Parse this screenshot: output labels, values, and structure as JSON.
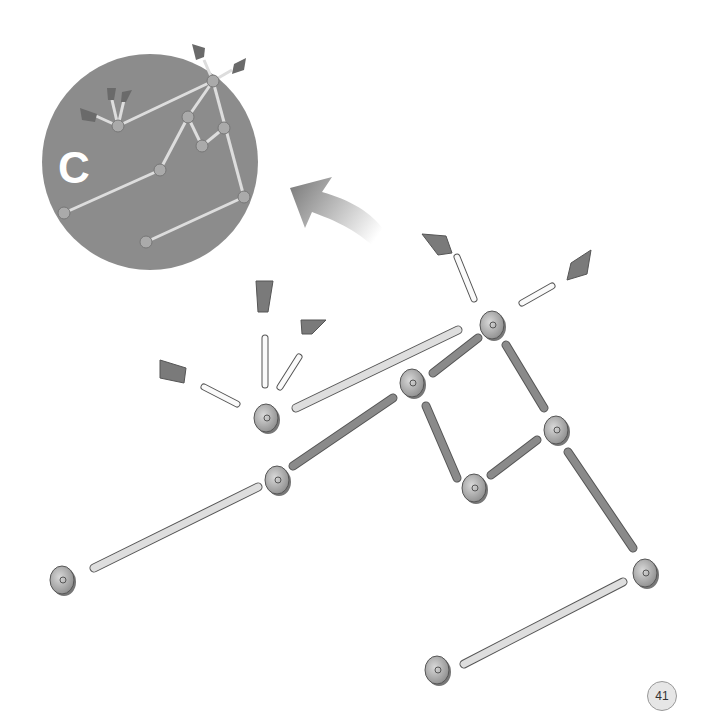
{
  "page": {
    "number": "41"
  },
  "inset": {
    "step_label": "C",
    "circle_color": "#8c8c8c"
  },
  "arrow": {
    "direction": "up-left",
    "color": "#808080"
  },
  "colors": {
    "rod_light": "#e4e4e4",
    "rod_dark": "#8a8a8a",
    "hub": "#a8a8a8",
    "flag": "#7a7a7a",
    "leader": "#555555"
  },
  "parts": {
    "hubs": [
      {
        "id": "h1",
        "x": 266,
        "y": 418
      },
      {
        "id": "h2",
        "x": 492,
        "y": 325
      },
      {
        "id": "h3",
        "x": 412,
        "y": 383
      },
      {
        "id": "h4",
        "x": 556,
        "y": 430
      },
      {
        "id": "h5",
        "x": 474,
        "y": 488
      },
      {
        "id": "h6",
        "x": 277,
        "y": 480
      },
      {
        "id": "h7",
        "x": 62,
        "y": 580
      },
      {
        "id": "h8",
        "x": 645,
        "y": 573
      },
      {
        "id": "h9",
        "x": 437,
        "y": 670
      }
    ],
    "rods": [
      {
        "x1": 296,
        "y1": 408,
        "x2": 458,
        "y2": 330,
        "type": "light"
      },
      {
        "x1": 433,
        "y1": 373,
        "x2": 478,
        "y2": 338,
        "type": "dark"
      },
      {
        "x1": 293,
        "y1": 466,
        "x2": 393,
        "y2": 398,
        "type": "dark"
      },
      {
        "x1": 426,
        "y1": 406,
        "x2": 457,
        "y2": 478,
        "type": "dark"
      },
      {
        "x1": 491,
        "y1": 475,
        "x2": 537,
        "y2": 440,
        "type": "dark"
      },
      {
        "x1": 506,
        "y1": 345,
        "x2": 544,
        "y2": 408,
        "type": "dark"
      },
      {
        "x1": 94,
        "y1": 568,
        "x2": 258,
        "y2": 487,
        "type": "light"
      },
      {
        "x1": 568,
        "y1": 452,
        "x2": 633,
        "y2": 548,
        "type": "dark"
      },
      {
        "x1": 464,
        "y1": 664,
        "x2": 623,
        "y2": 582,
        "type": "light"
      },
      {
        "x1": 204,
        "y1": 387,
        "x2": 237,
        "y2": 404,
        "type": "white"
      },
      {
        "x1": 265,
        "y1": 338,
        "x2": 265,
        "y2": 385,
        "type": "white"
      },
      {
        "x1": 280,
        "y1": 387,
        "x2": 299,
        "y2": 357,
        "type": "white"
      },
      {
        "x1": 457,
        "y1": 257,
        "x2": 474,
        "y2": 299,
        "type": "white"
      },
      {
        "x1": 522,
        "y1": 303,
        "x2": 552,
        "y2": 286,
        "type": "white"
      }
    ],
    "flags": [
      {
        "points": "160,360 186,368 184,383 160,378"
      },
      {
        "points": "256,281 273,281 268,312 258,312"
      },
      {
        "points": "301,320 326,320 312,334 302,334"
      },
      {
        "points": "422,234 446,236 452,253 438,255"
      },
      {
        "points": "571,263 591,250 587,274 567,280"
      }
    ]
  }
}
